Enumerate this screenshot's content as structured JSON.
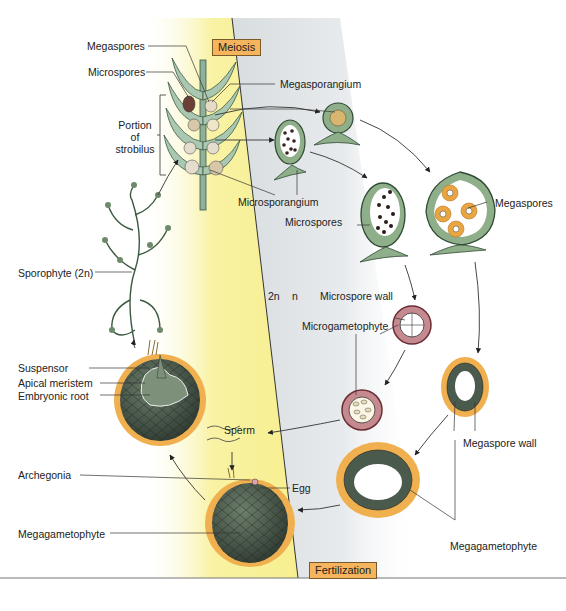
{
  "figure": {
    "phase_boxes": {
      "meiosis": "Meiosis",
      "fertilization": "Fertilization"
    },
    "ploidy": {
      "diploid": "2n",
      "haploid": "n"
    },
    "labels": {
      "megaspores_top": "Megaspores",
      "microspores_top": "Microspores",
      "portion_of_strobilus": [
        "Portion",
        "of",
        "strobilus"
      ],
      "megasporangium": "Megasporangium",
      "microsporangium": "Microsporangium",
      "microspores_right": "Microspores",
      "megaspores_right": "Megaspores",
      "sporophyte": "Sporophyte (2n)",
      "microspore_wall": "Microspore wall",
      "microgametophyte": "Microgametophyte",
      "suspensor": "Suspensor",
      "apical_meristem": "Apical meristem",
      "embryonic_root": "Embryonic root",
      "sperm": "Sperm",
      "megaspore_wall": "Megaspore wall",
      "archegonia": "Archegonia",
      "egg": "Egg",
      "megagametophyte_left": "Megagametophyte",
      "megagametophyte_right": "Megagametophyte"
    },
    "colors": {
      "diploid_band": "#f7ef8e",
      "haploid_band": "#dfe3e6",
      "tissue_green": "#5f7a60",
      "tissue_dark": "#3f4a40",
      "megaspore_orange": "#e9a640",
      "microspore_pink": "#c58a8f",
      "phase_box": "#f6b45c"
    }
  }
}
